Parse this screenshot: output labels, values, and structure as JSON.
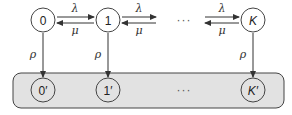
{
  "diagram": {
    "type": "markov-chain",
    "top_states": [
      {
        "id": "0",
        "label": "0"
      },
      {
        "id": "1",
        "label": "1"
      },
      {
        "id": "K",
        "label": "K"
      }
    ],
    "bottom_states": [
      {
        "id": "0p",
        "label": "0′"
      },
      {
        "id": "1p",
        "label": "1′"
      },
      {
        "id": "Kp",
        "label": "K′"
      }
    ],
    "ellipsis": "···",
    "transitions": {
      "forward_rate": "λ",
      "backward_rate": "μ",
      "absorb_rate": "ρ"
    },
    "colors": {
      "stroke": "#333333",
      "box_fill": "#e2e2e2",
      "node_fill": "#ffffff"
    }
  }
}
